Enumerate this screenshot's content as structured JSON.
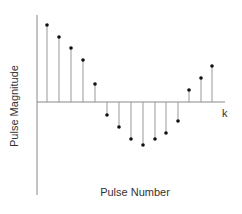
{
  "chart_data": {
    "type": "stem",
    "title": "",
    "xlabel": "Pulse Number",
    "ylabel": "Pulse Magnitude",
    "axis_end_label": "k",
    "grid": false,
    "legend": null,
    "x": [
      1,
      2,
      3,
      4,
      5,
      6,
      7,
      8,
      9,
      10,
      11,
      12,
      13,
      14,
      15
    ],
    "values": [
      77,
      65,
      54,
      42,
      18,
      -13,
      -25,
      -37,
      -43,
      -37,
      -31,
      -19,
      12,
      24,
      36
    ],
    "units_note": "relative magnitudes (no tick labels shown)",
    "colors": {
      "axis": "#888888",
      "stem": "#999999",
      "marker": "#111111"
    }
  },
  "layout": {
    "origin_x": 37,
    "baseline_y": 102,
    "axis_top": 15,
    "axis_bottom": 195,
    "axis_right": 225,
    "stem_x": [
      47,
      59,
      71,
      83,
      95,
      107,
      119,
      131,
      143,
      155,
      166,
      178,
      189,
      201,
      212
    ]
  }
}
